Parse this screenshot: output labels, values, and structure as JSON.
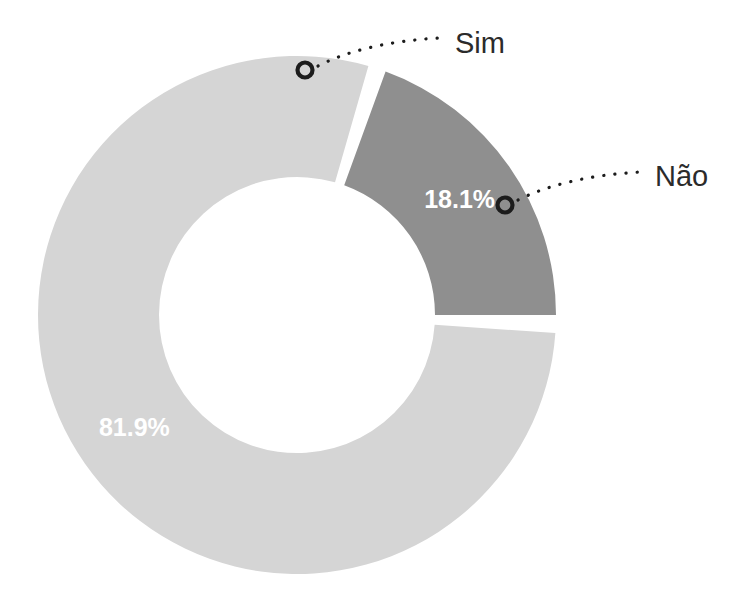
{
  "chart_data": {
    "type": "pie",
    "variant": "donut",
    "title": "",
    "subtitle": "",
    "xlabel": "",
    "ylabel": "",
    "grid": false,
    "legend_position": "none",
    "label_format": "percent",
    "total_percent": 100,
    "categories": [
      "Sim",
      "Não"
    ],
    "values": [
      81.9,
      18.1
    ],
    "value_labels": [
      "81.9%",
      "18.1%"
    ],
    "colors": [
      "#d5d5d5",
      "#8f8f8f"
    ],
    "slices": [
      {
        "name": "Sim",
        "value": 81.9,
        "value_label": "81.9%",
        "color": "#d5d5d5",
        "start_angle_deg": 94,
        "end_angle_deg": 16,
        "label_text_color": "#ffffff",
        "callout_label": "Sim"
      },
      {
        "name": "Não",
        "value": 18.1,
        "value_label": "18.1%",
        "color": "#8f8f8f",
        "start_angle_deg": 20,
        "end_angle_deg": 90,
        "label_text_color": "#ffffff",
        "callout_label": "Não"
      }
    ],
    "geometry": {
      "center_x": 297,
      "center_y": 315,
      "outer_radius": 259,
      "inner_radius": 138,
      "slice_gap_deg": 4
    },
    "annotations": [
      {
        "text": "Sim",
        "marker_x": 305,
        "marker_y": 70,
        "text_x": 455,
        "text_y": 45
      },
      {
        "text": "Não",
        "marker_x": 505,
        "marker_y": 205,
        "text_x": 655,
        "text_y": 178
      }
    ],
    "background_color": "#ffffff"
  }
}
